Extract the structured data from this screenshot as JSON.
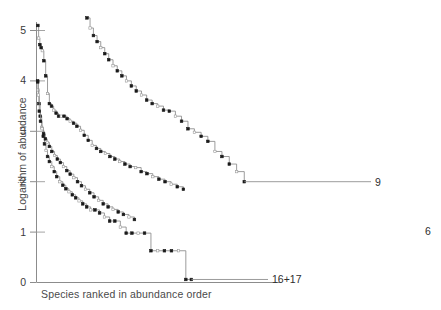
{
  "figure": {
    "background": "#ffffff",
    "line_color": "#8a8a8a",
    "marker_fill_color": "#1a1a1a",
    "marker_open_color": "#ffffff",
    "axis_color": "#8c8c8c",
    "text_color": "#4a4a4a"
  },
  "chart_data": {
    "type": "line",
    "title": "",
    "subtitle": "",
    "xlabel": "Species ranked in abundance order",
    "ylabel": "Logarithm of abundance",
    "xlim": [
      0,
      80
    ],
    "ylim": [
      0,
      5.35
    ],
    "yticks": [
      0,
      1,
      2,
      3,
      4,
      5
    ],
    "ytick_labels": [
      "0",
      "1",
      "2",
      "3",
      "4",
      "5"
    ],
    "xticks": [],
    "xtick_labels": [],
    "grid": false,
    "legend_position": "inline-right-end",
    "annotations": [
      {
        "text": "9",
        "x": 78.0,
        "y": 2.0
      },
      {
        "text": "6",
        "x": 79.5,
        "y": 1.0
      },
      {
        "text": "16+17",
        "x": 52.5,
        "y": 0.06
      }
    ],
    "series": [
      {
        "name": "16+17",
        "label": "16+17",
        "end_label": "16+17",
        "marker": "mixed-step",
        "x": [
          0.35,
          0.5,
          0.8,
          1.2,
          1.7,
          2.2,
          2.6,
          3.1,
          3.6,
          4.2,
          5.0,
          5.8,
          6.6,
          7.6,
          8.6,
          9.6,
          10.6,
          11.7,
          12.8,
          13.9,
          15.1,
          16.4,
          17.7,
          19.1,
          20.6,
          22.2,
          23.9,
          25.6,
          27.4,
          29.3,
          31.2,
          33.2,
          35.3,
          37.4,
          39.6,
          41.8,
          44.1,
          46.4,
          48.8,
          50.6
        ],
        "y": [
          4.0,
          3.82,
          3.55,
          3.3,
          3.08,
          2.9,
          2.75,
          2.62,
          2.5,
          2.4,
          2.3,
          2.2,
          2.1,
          2.0,
          1.93,
          1.86,
          1.8,
          1.74,
          1.68,
          1.62,
          1.56,
          1.5,
          1.44,
          1.44,
          1.38,
          1.3,
          1.22,
          1.22,
          1.1,
          0.98,
          0.98,
          0.98,
          0.98,
          0.63,
          0.63,
          0.63,
          0.63,
          0.63,
          0.06,
          0.06
        ]
      },
      {
        "name": "curve-b",
        "label": "",
        "end_label": "",
        "marker": "mixed-step",
        "x": [
          0.45,
          0.7,
          1.1,
          1.5,
          1.9,
          2.4,
          3.0,
          3.6,
          4.2,
          4.9,
          5.6,
          6.4,
          7.2,
          8.1,
          9.0,
          10.0,
          11.0,
          12.1,
          13.2,
          14.4,
          15.6,
          16.9,
          18.2,
          19.6,
          21.0,
          22.5,
          24.0,
          25.6,
          27.2,
          28.9,
          30.6,
          32.4,
          34.2,
          36.1,
          38.0,
          40.0,
          42.0,
          44.0,
          46.0,
          48.0
        ],
        "y": [
          5.1,
          4.85,
          4.72,
          4.66,
          4.6,
          4.4,
          4.1,
          3.75,
          3.55,
          3.5,
          3.42,
          3.36,
          3.3,
          3.3,
          3.3,
          3.25,
          3.2,
          3.16,
          3.1,
          3.02,
          2.92,
          2.82,
          2.72,
          2.66,
          2.6,
          2.56,
          2.5,
          2.45,
          2.4,
          2.35,
          2.3,
          2.28,
          2.2,
          2.16,
          2.1,
          2.05,
          2.0,
          1.95,
          1.9,
          1.85
        ]
      },
      {
        "name": "curve-c",
        "label": "",
        "end_label": "",
        "marker": "mixed-step",
        "x": [
          0.4,
          0.6,
          0.9,
          1.3,
          1.8,
          2.3,
          2.9,
          3.5,
          4.2,
          5.0,
          5.9,
          6.8,
          7.8,
          8.8,
          9.9,
          11.0,
          12.2,
          13.4,
          14.7,
          16.0,
          17.4,
          18.8,
          20.3,
          21.8,
          23.4,
          25.0,
          26.7,
          28.4,
          30.2,
          32.0
        ],
        "y": [
          3.98,
          3.72,
          3.4,
          3.2,
          3.05,
          2.95,
          2.85,
          2.78,
          2.7,
          2.6,
          2.52,
          2.45,
          2.38,
          2.3,
          2.22,
          2.15,
          2.08,
          2.0,
          1.92,
          1.85,
          1.78,
          1.7,
          1.63,
          1.56,
          1.5,
          1.45,
          1.4,
          1.35,
          1.3,
          1.25
        ]
      },
      {
        "name": "9",
        "label": "9",
        "end_label": "9",
        "marker": "mixed-step",
        "x": [
          16.5,
          17.5,
          18.6,
          19.8,
          21.0,
          22.3,
          23.6,
          25.0,
          26.4,
          27.9,
          29.4,
          31.0,
          32.6,
          34.3,
          36.0,
          37.8,
          39.6,
          41.5,
          43.4,
          45.4,
          47.4,
          49.5,
          51.6,
          53.8,
          56.0,
          58.3,
          60.6,
          63.0,
          65.4,
          67.9
        ],
        "y": [
          5.25,
          5.05,
          4.9,
          4.78,
          4.66,
          4.54,
          4.42,
          4.3,
          4.2,
          4.1,
          4.0,
          3.9,
          3.8,
          3.72,
          3.62,
          3.55,
          3.5,
          3.42,
          3.4,
          3.3,
          3.2,
          3.05,
          2.98,
          2.9,
          2.8,
          2.6,
          2.5,
          2.35,
          2.2,
          2.0
        ]
      }
    ]
  }
}
